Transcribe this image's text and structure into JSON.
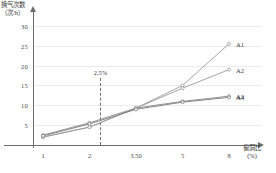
{
  "chart_data": {
    "type": "line",
    "title": "",
    "xlabel": "窗洞比",
    "xlabel_unit": "(%)",
    "ylabel": "换气次数",
    "ylabel_unit": "(次/h)",
    "categories": [
      "1",
      "2",
      "3.50",
      "5",
      "8"
    ],
    "ytick_labels": [
      "5",
      "10",
      "15",
      "20",
      "25",
      "30"
    ],
    "ytick_values": [
      5,
      10,
      15,
      20,
      25,
      30
    ],
    "ylim": [
      0,
      32
    ],
    "grid": "horizontal",
    "legend_position": "right-inline",
    "series": [
      {
        "name": "A1",
        "values": [
          2.0,
          4.5,
          9.3,
          15.0,
          25.5
        ],
        "color": "#9b9b9b"
      },
      {
        "name": "A2",
        "values": [
          2.0,
          4.5,
          9.3,
          14.3,
          19.0
        ],
        "color": "#9b9b9b"
      },
      {
        "name": "A3",
        "values": [
          2.5,
          5.6,
          9.3,
          11.0,
          12.3
        ],
        "color": "#8a8a8a"
      },
      {
        "name": "A4",
        "values": [
          2.3,
          5.3,
          9.0,
          10.8,
          12.0
        ],
        "color": "#7a7a7a"
      }
    ],
    "annotations": [
      {
        "text": "2.5%",
        "x_value": 2.35,
        "note": "dashed vertical reference line"
      }
    ]
  },
  "axes": {
    "y_title_line1": "换气次数",
    "y_title_line2": "（次/h）",
    "x_title_line1": "窗洞比",
    "x_title_line2": "(%)"
  },
  "caption": {
    "text": ""
  }
}
